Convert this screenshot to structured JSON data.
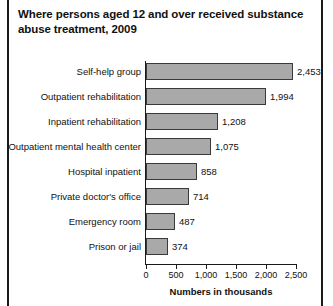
{
  "title": "Where persons aged 12 and over received substance abuse treatment, 2009",
  "chart_data": {
    "type": "bar",
    "orientation": "horizontal",
    "title": "Where persons aged 12 and over received substance abuse treatment, 2009",
    "xlabel": "Numbers in thousands",
    "ylabel": "",
    "xlim": [
      0,
      2500
    ],
    "grid": false,
    "legend": "none",
    "tick_labels": [
      "0",
      "500",
      "1,000",
      "1,500",
      "2,000",
      "2,500"
    ],
    "ticks": [
      0,
      500,
      1000,
      1500,
      2000,
      2500
    ],
    "categories": [
      "Self-help group",
      "Outpatient rehabilitation",
      "Inpatient rehabilitation",
      "Outpatient mental health center",
      "Hospital inpatient",
      "Private doctor's office",
      "Emergency room",
      "Prison or jail"
    ],
    "values": [
      2453,
      1994,
      1208,
      1075,
      858,
      714,
      487,
      374
    ],
    "value_labels": [
      "2,453",
      "1,994",
      "1,208",
      "1,075",
      "858",
      "714",
      "487",
      "374"
    ],
    "bar_color": "#a9a9a9",
    "bar_edge_color": "#3a3a3a",
    "axis_color": "#1a1a1a"
  }
}
